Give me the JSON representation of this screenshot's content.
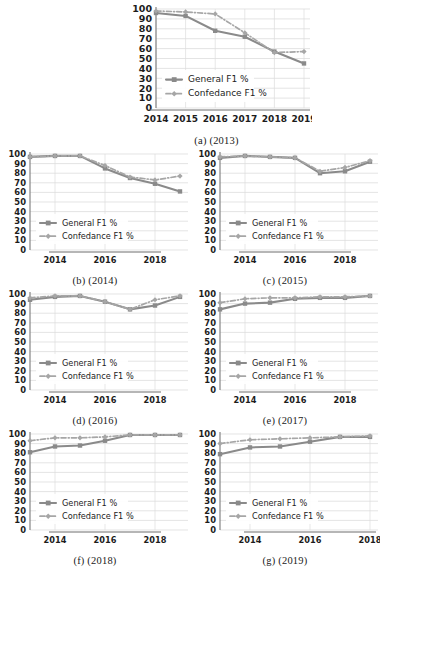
{
  "figure": {
    "title": "",
    "series_names": {
      "general": "General F1 %",
      "confedance": "Confedance F1 %"
    },
    "colors": {
      "general": "#8a8a8a",
      "confedance": "#a6a6a6",
      "gridline": "#d9d9d9",
      "axis": "#7a7a7a",
      "text": "#1c1c1c",
      "background": "#ffffff"
    },
    "y_ticks": [
      0,
      10,
      20,
      30,
      40,
      50,
      60,
      70,
      80,
      90,
      100
    ],
    "captions": [
      "(a) (2013)",
      "(b) (2014)",
      "(c) (2015)",
      "(d) (2016)",
      "(e) (2017)",
      "(f) (2018)",
      "(g) (2019)"
    ]
  },
  "chart_data": [
    {
      "id": "a",
      "type": "line",
      "title": "",
      "caption": "(a) (2013)",
      "xlabel": "",
      "ylabel": "",
      "ylim": [
        0,
        100
      ],
      "grid": true,
      "legend_position": "lower-left",
      "x": [
        2014,
        2015,
        2016,
        2017,
        2018,
        2019
      ],
      "xticklabels": [
        "2014",
        "2015",
        "2016",
        "2017",
        "2018",
        "2019"
      ],
      "series": [
        {
          "name": "General F1 %",
          "values": [
            96,
            93,
            78,
            72,
            57,
            45
          ]
        },
        {
          "name": "Confedance F1 %",
          "values": [
            98,
            97,
            95,
            76,
            56,
            57
          ]
        }
      ]
    },
    {
      "id": "b",
      "type": "line",
      "title": "",
      "caption": "(b) (2014)",
      "xlabel": "",
      "ylabel": "",
      "ylim": [
        0,
        100
      ],
      "grid": true,
      "legend_position": "lower-left",
      "x": [
        2013,
        2014,
        2015,
        2016,
        2017,
        2018,
        2019
      ],
      "xticklabels": [
        "",
        "2014",
        "",
        "2016",
        "",
        "2018",
        ""
      ],
      "series": [
        {
          "name": "General F1 %",
          "values": [
            97,
            98,
            98,
            85,
            75,
            69,
            61
          ]
        },
        {
          "name": "Confedance F1 %",
          "values": [
            97,
            98,
            98,
            88,
            76,
            73,
            77
          ]
        }
      ]
    },
    {
      "id": "c",
      "type": "line",
      "title": "",
      "caption": "(c) (2015)",
      "xlabel": "",
      "ylabel": "",
      "ylim": [
        0,
        100
      ],
      "grid": true,
      "legend_position": "lower-left",
      "x": [
        2013,
        2014,
        2015,
        2016,
        2017,
        2018,
        2019
      ],
      "xticklabels": [
        "",
        "2014",
        "",
        "2016",
        "",
        "2018",
        ""
      ],
      "series": [
        {
          "name": "General F1 %",
          "values": [
            96,
            98,
            97,
            96,
            80,
            82,
            92
          ]
        },
        {
          "name": "Confedance F1 %",
          "values": [
            97,
            98,
            97,
            96,
            82,
            86,
            93
          ]
        }
      ]
    },
    {
      "id": "d",
      "type": "line",
      "title": "",
      "caption": "(d) (2016)",
      "xlabel": "",
      "ylabel": "",
      "ylim": [
        0,
        100
      ],
      "grid": true,
      "legend_position": "lower-left",
      "x": [
        2013,
        2014,
        2015,
        2016,
        2017,
        2018,
        2019
      ],
      "xticklabels": [
        "",
        "2014",
        "",
        "2016",
        "",
        "2018",
        ""
      ],
      "series": [
        {
          "name": "General F1 %",
          "values": [
            94,
            97,
            98,
            92,
            84,
            88,
            97
          ]
        },
        {
          "name": "Confedance F1 %",
          "values": [
            96,
            98,
            98,
            92,
            84,
            94,
            98
          ]
        }
      ]
    },
    {
      "id": "e",
      "type": "line",
      "title": "",
      "caption": "(e) (2017)",
      "xlabel": "",
      "ylabel": "",
      "ylim": [
        0,
        100
      ],
      "grid": true,
      "legend_position": "lower-left",
      "x": [
        2013,
        2014,
        2015,
        2016,
        2017,
        2018,
        2019
      ],
      "xticklabels": [
        "",
        "2014",
        "",
        "2016",
        "",
        "2018",
        ""
      ],
      "series": [
        {
          "name": "General F1 %",
          "values": [
            84,
            90,
            91,
            95,
            96,
            96,
            98
          ]
        },
        {
          "name": "Confedance F1 %",
          "values": [
            91,
            95,
            96,
            96,
            97,
            97,
            98
          ]
        }
      ]
    },
    {
      "id": "f",
      "type": "line",
      "title": "",
      "caption": "(f) (2018)",
      "xlabel": "",
      "ylabel": "",
      "ylim": [
        0,
        100
      ],
      "grid": true,
      "legend_position": "lower-left",
      "x": [
        2013,
        2014,
        2015,
        2016,
        2017,
        2018,
        2019
      ],
      "xticklabels": [
        "",
        "2014",
        "",
        "2016",
        "",
        "2018",
        ""
      ],
      "series": [
        {
          "name": "General F1 %",
          "values": [
            81,
            87,
            88,
            93,
            99,
            99,
            99
          ]
        },
        {
          "name": "Confedance F1 %",
          "values": [
            93,
            96,
            96,
            97,
            99,
            99,
            99
          ]
        }
      ]
    },
    {
      "id": "g",
      "type": "line",
      "title": "",
      "caption": "(g) (2019)",
      "xlabel": "",
      "ylabel": "",
      "ylim": [
        0,
        100
      ],
      "grid": true,
      "legend_position": "lower-left",
      "x": [
        2013,
        2014,
        2015,
        2016,
        2017,
        2018
      ],
      "xticklabels": [
        "",
        "2014",
        "",
        "2016",
        "",
        "2018"
      ],
      "series": [
        {
          "name": "General F1 %",
          "values": [
            79,
            86,
            87,
            92,
            97,
            97
          ]
        },
        {
          "name": "Confedance F1 %",
          "values": [
            90,
            94,
            95,
            96,
            97,
            98
          ]
        }
      ]
    }
  ]
}
